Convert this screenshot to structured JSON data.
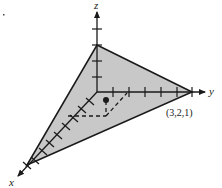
{
  "figure": {
    "axes": {
      "x_label": "x",
      "y_label": "y",
      "z_label": "z"
    },
    "point": {
      "label": "(3,2,1)",
      "coords": [
        3,
        2,
        1
      ]
    },
    "colors": {
      "plane_fill": "#c8c8c8",
      "line": "#1a1a1a",
      "background": "#ffffff"
    }
  }
}
